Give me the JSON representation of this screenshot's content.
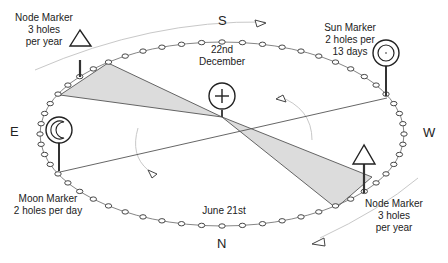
{
  "directions": {
    "south": "S",
    "north": "N",
    "east": "E",
    "west": "W"
  },
  "dates": {
    "winter": [
      "22nd",
      "December"
    ],
    "summer": "June 21st"
  },
  "markers": {
    "node_top": {
      "name": "Node Marker",
      "lines": [
        "Node Marker",
        "3 holes",
        "per year"
      ],
      "symbol": "triangle-icon"
    },
    "node_bottom": {
      "name": "Node Marker",
      "lines": [
        "Node Marker",
        "3 holes",
        "per year"
      ],
      "symbol": "triangle-icon"
    },
    "sun": {
      "name": "Sun Marker",
      "lines": [
        "Sun Marker",
        "2 holes per",
        "13 days"
      ],
      "symbol": "double-circle-icon"
    },
    "moon": {
      "name": "Moon Marker",
      "lines": [
        "Moon Marker",
        "2 holes per day"
      ],
      "symbol": "crescent-icon"
    },
    "earth": {
      "symbol": "circle-cross-icon"
    }
  },
  "colors": {
    "line": "#555555",
    "shade": "#d9d9d9",
    "arrow": "#bbbbbb",
    "text": "#222222"
  },
  "ring": {
    "hole_count": 56
  }
}
